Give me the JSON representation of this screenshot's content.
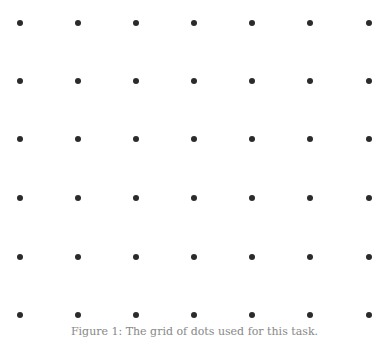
{
  "figure": {
    "caption": "Figure 1: The grid of dots used for this task.",
    "dot_color": "#2b2b2b",
    "grid": {
      "columns": 7,
      "rows": 6,
      "x_positions": [
        20,
        78,
        136,
        194,
        252,
        310,
        369
      ],
      "y_positions": [
        23,
        81,
        139,
        198,
        257,
        315
      ]
    }
  }
}
